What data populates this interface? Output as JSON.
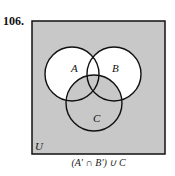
{
  "problem_number": "106.",
  "universe_label": "U",
  "sets": [
    {
      "label": "A",
      "cx": 72,
      "cy": 74,
      "r": 27
    },
    {
      "label": "B",
      "cx": 114,
      "cy": 74,
      "r": 27
    },
    {
      "label": "C",
      "cx": 94,
      "cy": 103,
      "r": 28
    }
  ],
  "expression": "(A′ ∩ B′) ∪ C",
  "colors": {
    "shaded": "#c8c8c8",
    "unshaded": "#ffffff",
    "stroke": "#111111"
  }
}
